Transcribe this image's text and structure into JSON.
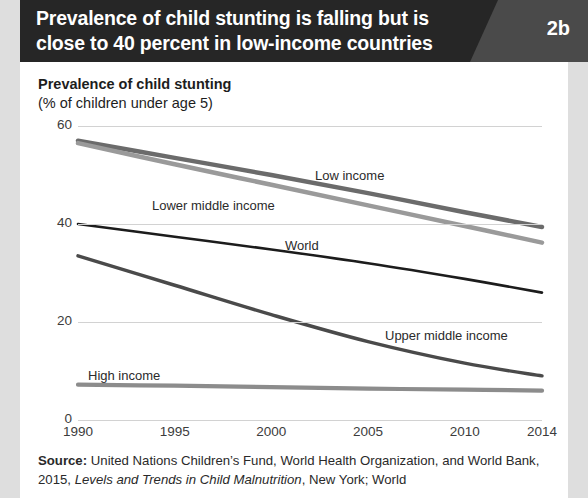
{
  "banner": {
    "title": "Prevalence of child stunting is falling but is close to 40 percent in low-income countries",
    "number": "2b"
  },
  "chart_titles": {
    "line1": "Prevalence of child stunting",
    "line2": "(% of children under age 5)"
  },
  "source": {
    "label": "Source:",
    "text_a": " United Nations Children’s Fund, World Health Organization, and World Bank, 2015, ",
    "italic": "Levels and Trends in Child Malnutrition",
    "text_b": ", New York; World"
  },
  "chart_data": {
    "type": "line",
    "title": "Prevalence of child stunting",
    "subtitle": "(% of children under age 5)",
    "xlabel": "",
    "ylabel": "Prevalence of child stunting (% of children under age 5)",
    "xlim": [
      1990,
      2014
    ],
    "ylim": [
      0,
      60
    ],
    "xticks": [
      1990,
      1995,
      2000,
      2005,
      2010,
      2014
    ],
    "xtick_labels": [
      "1990",
      "1995",
      "2000",
      "2005",
      "2010",
      "2014"
    ],
    "yticks": [
      0,
      20,
      40,
      60
    ],
    "ytick_labels": [
      "0",
      "20",
      "40",
      "60"
    ],
    "grid": "horizontal",
    "legend": "inline-labels",
    "x": [
      1990,
      1995,
      2000,
      2005,
      2010,
      2014
    ],
    "series": [
      {
        "name": "Low income",
        "color": "#6b6b6b",
        "width": 4.5,
        "values": [
          57.0,
          53.5,
          50.0,
          46.3,
          42.4,
          39.4
        ],
        "label_x": 315,
        "label_y": 168
      },
      {
        "name": "Lower middle income",
        "color": "#9a9a9a",
        "width": 4.5,
        "values": [
          56.5,
          52.2,
          48.0,
          43.8,
          39.6,
          36.2
        ],
        "label_x": 152,
        "label_y": 198
      },
      {
        "name": "World",
        "color": "#1c1c1c",
        "width": 2.6,
        "values": [
          40.0,
          37.4,
          34.8,
          32.0,
          28.8,
          26.0
        ],
        "label_x": 285,
        "label_y": 238
      },
      {
        "name": "Upper middle income",
        "color": "#4a4a4a",
        "width": 3.4,
        "values": [
          33.5,
          27.5,
          21.5,
          16.0,
          11.6,
          9.0
        ],
        "label_x": 385,
        "label_y": 328
      },
      {
        "name": "High income",
        "color": "#8c8c8c",
        "width": 4.2,
        "values": [
          7.2,
          7.0,
          6.7,
          6.4,
          6.2,
          6.0
        ],
        "label_x": 88,
        "label_y": 368
      }
    ]
  }
}
